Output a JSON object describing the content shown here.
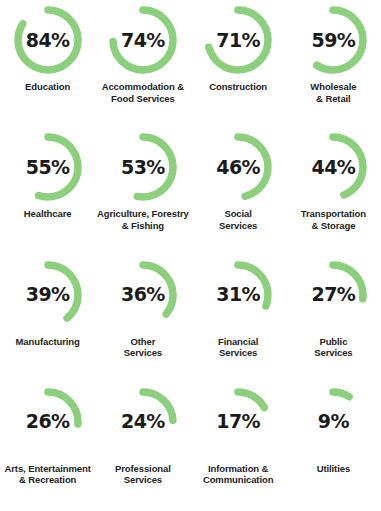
{
  "chart_data": {
    "type": "pie",
    "title": "",
    "subtitle": "",
    "xlabel": "",
    "ylabel": "",
    "legend": "none",
    "grid": false,
    "value_suffix": "%",
    "arc_start_angle_deg": 0,
    "arc_direction": "clockwise",
    "ring_track_visible": false,
    "colors": {
      "arc": "#8ccf7d",
      "arc_light": "#a8dd9b",
      "value_text": "#1b1b1b",
      "label_text": "#232323",
      "background": "#ffffff"
    },
    "categories": [
      "Education",
      "Accommodation &\nFood Services",
      "Construction",
      "Wholesale\n& Retail",
      "Healthcare",
      "Agriculture, Forestry\n& Fishing",
      "Social\nServices",
      "Transportation\n& Storage",
      "Manufacturing",
      "Other\nServices",
      "Financial\nServices",
      "Public\nServices",
      "Arts, Entertainment\n& Recreation",
      "Professional\nServices",
      "Information &\nCommunication",
      "Utilities"
    ],
    "values": [
      84,
      74,
      71,
      59,
      55,
      53,
      46,
      44,
      39,
      36,
      31,
      27,
      26,
      24,
      17,
      9
    ]
  },
  "donuts": [
    {
      "value_label": "84%",
      "value": 84,
      "label": "Education"
    },
    {
      "value_label": "74%",
      "value": 74,
      "label": "Accommodation &\nFood Services"
    },
    {
      "value_label": "71%",
      "value": 71,
      "label": "Construction"
    },
    {
      "value_label": "59%",
      "value": 59,
      "label": "Wholesale\n& Retail"
    },
    {
      "value_label": "55%",
      "value": 55,
      "label": "Healthcare"
    },
    {
      "value_label": "53%",
      "value": 53,
      "label": "Agriculture, Forestry\n& Fishing"
    },
    {
      "value_label": "46%",
      "value": 46,
      "label": "Social\nServices"
    },
    {
      "value_label": "44%",
      "value": 44,
      "label": "Transportation\n& Storage"
    },
    {
      "value_label": "39%",
      "value": 39,
      "label": "Manufacturing"
    },
    {
      "value_label": "36%",
      "value": 36,
      "label": "Other\nServices"
    },
    {
      "value_label": "31%",
      "value": 31,
      "label": "Financial\nServices"
    },
    {
      "value_label": "27%",
      "value": 27,
      "label": "Public\nServices"
    },
    {
      "value_label": "26%",
      "value": 26,
      "label": "Arts, Entertainment\n& Recreation"
    },
    {
      "value_label": "24%",
      "value": 24,
      "label": "Professional\nServices"
    },
    {
      "value_label": "17%",
      "value": 17,
      "label": "Information &\nCommunication"
    },
    {
      "value_label": "9%",
      "value": 9,
      "label": "Utilities"
    }
  ]
}
